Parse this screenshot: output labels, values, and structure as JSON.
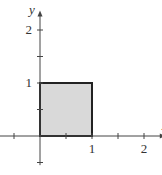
{
  "chart_data": {
    "type": "area",
    "title": "",
    "xlabel": "x",
    "ylabel": "y",
    "xlim": [
      -1,
      2.4
    ],
    "ylim": [
      -0.55,
      2.35
    ],
    "grid": false,
    "x_ticks": [
      -0.5,
      0.5,
      1,
      1.5,
      2
    ],
    "y_ticks": [
      -0.5,
      0.5,
      1,
      1.5,
      2
    ],
    "x_tick_labels": [
      {
        "value": 1,
        "label": "1"
      },
      {
        "value": 2,
        "label": "2"
      }
    ],
    "y_tick_labels": [
      {
        "value": 1,
        "label": "1"
      },
      {
        "value": 2,
        "label": "2"
      }
    ],
    "shaded_region": {
      "shape": "square",
      "vertices": [
        [
          0,
          0
        ],
        [
          1,
          0
        ],
        [
          1,
          1
        ],
        [
          0,
          1
        ]
      ],
      "fill": "#d9d9d9",
      "stroke": "#222222"
    }
  }
}
